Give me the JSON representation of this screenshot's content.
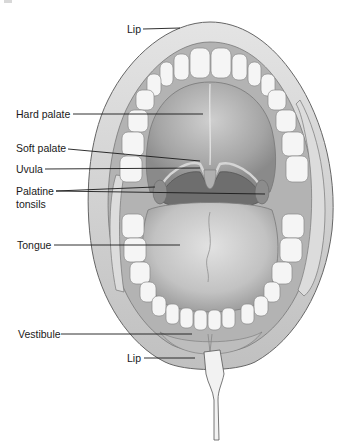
{
  "figure": {
    "palette": {
      "outline": "#555555",
      "lip": "#d6d6d6",
      "lip_shade": "#bdbdbd",
      "gum": "#b5b5b5",
      "tooth": "#f4f4f4",
      "tooth_line": "#8a8a8a",
      "palate": "#a9a9a9",
      "palate_light": "#c9c9c9",
      "throat": "#6e6e6e",
      "tonsil": "#8c8c8c",
      "tongue": "#c4c4c4",
      "tongue_light": "#dedede",
      "leader": "#1a1a1a"
    }
  },
  "labels": [
    {
      "id": "lip_top",
      "text": "Lip",
      "x": 127,
      "y": 23
    },
    {
      "id": "hard_palate",
      "text": "Hard palate",
      "x": 16,
      "y": 108
    },
    {
      "id": "soft_palate",
      "text": "Soft palate",
      "x": 16,
      "y": 142
    },
    {
      "id": "uvula",
      "text": "Uvula",
      "x": 16,
      "y": 163
    },
    {
      "id": "palatine",
      "text": "Palatine",
      "x": 16,
      "y": 185
    },
    {
      "id": "tonsils",
      "text": "tonsils",
      "x": 16,
      "y": 198
    },
    {
      "id": "tongue",
      "text": "Tongue",
      "x": 17,
      "y": 239
    },
    {
      "id": "vestibule",
      "text": "Vestibule",
      "x": 18,
      "y": 328
    },
    {
      "id": "lip_bottom",
      "text": "Lip",
      "x": 127,
      "y": 352
    }
  ],
  "leaders": [
    {
      "for": "lip_top",
      "x1": 143,
      "y1": 29,
      "x2": 180,
      "y2": 28
    },
    {
      "for": "hard_palate",
      "x1": 73,
      "y1": 114,
      "x2": 203,
      "y2": 114
    },
    {
      "for": "soft_palate",
      "x1": 68,
      "y1": 149,
      "x2": 200,
      "y2": 161
    },
    {
      "for": "uvula",
      "x1": 45,
      "y1": 169,
      "x2": 200,
      "y2": 168
    },
    {
      "for": "palatine_a",
      "x1": 56,
      "y1": 191,
      "x2": 155,
      "y2": 187
    },
    {
      "for": "palatine_b",
      "x1": 56,
      "y1": 191,
      "x2": 265,
      "y2": 194
    },
    {
      "for": "tongue",
      "x1": 54,
      "y1": 245,
      "x2": 180,
      "y2": 245
    },
    {
      "for": "vestibule",
      "x1": 61,
      "y1": 334,
      "x2": 192,
      "y2": 334
    },
    {
      "for": "lip_bottom",
      "x1": 144,
      "y1": 358,
      "x2": 195,
      "y2": 358
    }
  ]
}
